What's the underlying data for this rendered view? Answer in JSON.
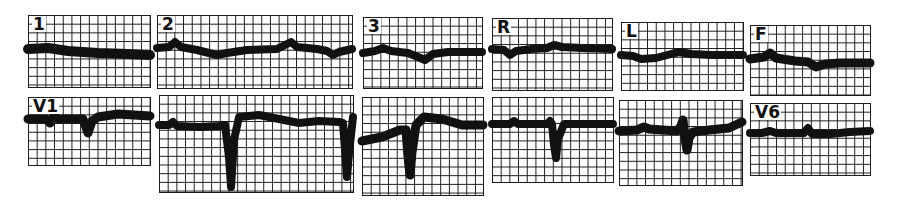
{
  "figure": {
    "type": "12-lead electrocardiogram tracing strips",
    "colors": {
      "grid": "#1a1a1a",
      "trace": "#111111",
      "paper": "#fdfdfd"
    },
    "rows": [
      {
        "name": "limb-leads",
        "leads": [
          {
            "label": "1",
            "box": [
              28,
              15,
              122,
              72
            ],
            "thick": 10,
            "path": "M0,34 L20,33 L40,36 L70,38 L100,39 L122,40"
          },
          {
            "label": "2",
            "box": [
              157,
              15,
              195,
              73
            ],
            "thick": 8,
            "path": "M0,33 L12,32 L18,27 L24,32 L40,35 L60,40 L70,38 L90,35 L120,34 L128,30 L134,27 L140,32 L160,34 L170,36 L176,40 L182,37 L195,34"
          },
          {
            "label": "3",
            "box": [
              363,
              17,
              119,
              71
            ],
            "thick": 8,
            "path": "M0,36 L12,34 L20,31 L28,34 L45,36 L55,40 L62,43 L70,37 L85,35 L119,35"
          },
          {
            "label": "R",
            "box": [
              492,
              18,
              120,
              72
            ],
            "thick": 8,
            "path": "M0,31 L12,32 L18,37 L24,33 L40,31 L55,30 L62,27 L70,29 L90,30 L120,31"
          },
          {
            "label": "L",
            "box": [
              621,
              22,
              122,
              68
            ],
            "thick": 8,
            "path": "M0,33 L12,34 L20,37 L35,36 L50,32 L58,30 L70,32 L90,33 L122,33"
          },
          {
            "label": "F",
            "box": [
              750,
              25,
              120,
              70
            ],
            "thick": 9,
            "path": "M0,34 L14,32 L20,28 L26,33 L45,36 L58,37 L66,42 L75,39 L90,38 L120,38"
          }
        ]
      },
      {
        "name": "precordial-leads",
        "leads": [
          {
            "label": "V1",
            "box": [
              28,
              97,
              122,
              68
            ],
            "thick": 9,
            "path": "M0,22 L18,22 L22,26 L26,19 L30,22 L55,22 L60,36 L64,24 L70,20 L90,17 L122,19"
          },
          {
            "label": "",
            "box": [
              159,
              95,
              194,
              97
            ],
            "thick": 8,
            "path": "M0,30 L10,30 L14,27 L18,31 L40,32 L60,31 L66,30 L70,62 L72,92 L75,45 L80,22 L100,20 L120,24 L140,28 L160,26 L180,27 L184,28 L188,82 L190,58 L194,22"
          },
          {
            "label": "",
            "box": [
              362,
              97,
              121,
              98
            ],
            "thick": 9,
            "path": "M0,44 L20,40 L38,33 L44,33 L46,60 L48,78 L50,55 L54,28 L62,20 L80,22 L100,28 L121,28"
          },
          {
            "label": "",
            "box": [
              492,
              97,
              121,
              85
            ],
            "thick": 8,
            "path": "M0,27 L18,27 L22,24 L26,27 L55,27 L58,24 L60,27 L62,48 L64,61 L66,42 L72,27 L121,27"
          },
          {
            "label": "",
            "box": [
              619,
              100,
              123,
              85
            ],
            "thick": 9,
            "path": "M0,31 L18,30 L25,27 L30,29 L58,31 L62,26 L64,20 L66,38 L68,50 L70,38 L74,32 L90,30 L110,28 L123,22"
          },
          {
            "label": "V6",
            "box": [
              750,
              103,
              120,
              72
            ],
            "thick": 8,
            "path": "M0,30 L12,30 L20,28 L26,30 L54,30 L58,25 L62,31 L80,31 L100,29 L120,28"
          }
        ]
      }
    ]
  }
}
